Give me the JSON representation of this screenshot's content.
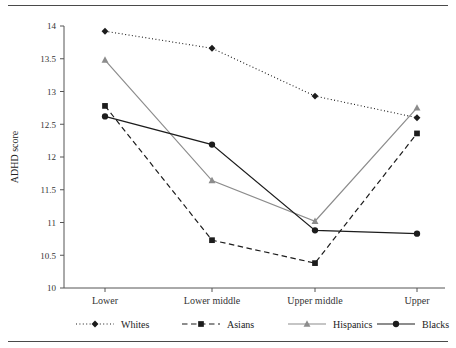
{
  "figure": {
    "rules": [
      "top-rule",
      "bottom-rule"
    ]
  },
  "chart_data": {
    "type": "line",
    "title": "",
    "xlabel": "",
    "ylabel": "ADHD score",
    "categories": [
      "Lower",
      "Lower middle",
      "Upper middle",
      "Upper"
    ],
    "ylim": [
      10,
      14
    ],
    "yticks": [
      "10",
      "10.5",
      "11",
      "11.5",
      "12",
      "12.5",
      "13",
      "13.5",
      "14"
    ],
    "ytick_values": [
      10,
      10.5,
      11,
      11.5,
      12,
      12.5,
      13,
      13.5,
      14
    ],
    "grid": false,
    "legend_position": "bottom",
    "series": [
      {
        "name": "Whites",
        "values": [
          13.92,
          13.66,
          12.93,
          12.6
        ],
        "color": "#1c1c1c",
        "linestyle": "dotted",
        "marker": "diamond"
      },
      {
        "name": "Asians",
        "values": [
          12.78,
          10.73,
          10.38,
          12.36
        ],
        "color": "#1c1c1c",
        "linestyle": "dashed",
        "marker": "square"
      },
      {
        "name": "Hispanics",
        "values": [
          13.48,
          11.64,
          11.02,
          12.75
        ],
        "color": "#8c8c8c",
        "linestyle": "solid",
        "marker": "triangle"
      },
      {
        "name": "Blacks",
        "values": [
          12.62,
          12.19,
          10.88,
          10.83
        ],
        "color": "#1c1c1c",
        "linestyle": "solid",
        "marker": "circle"
      }
    ]
  }
}
